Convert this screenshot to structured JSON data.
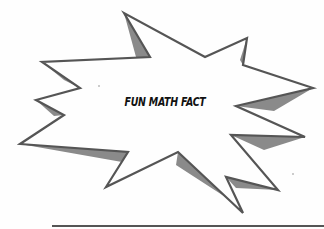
{
  "graphic": {
    "type": "starburst-callout",
    "label": "FUN MATH FACT",
    "colors": {
      "outline": "#555555",
      "shadow": "#8a8a8a",
      "fill": "#ffffff",
      "text": "#111111",
      "rule": "#555555"
    }
  },
  "writing_line": {
    "label": ""
  }
}
